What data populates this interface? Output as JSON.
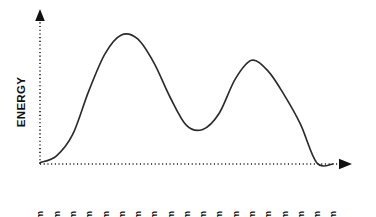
{
  "chart_data": {
    "type": "line",
    "title": "",
    "subtitle": "",
    "xlabel": "",
    "ylabel": "ENERGY",
    "grid": false,
    "legend": false,
    "legend_position": "none",
    "axis_style": "dotted-with-arrowheads",
    "xlim": [
      0,
      18
    ],
    "ylim": [
      0,
      100
    ],
    "categories": [
      "6am",
      "7am",
      "8am",
      "9am",
      "10am",
      "11am",
      "12pm",
      "1pm",
      "2pm",
      "3pm",
      "4pm",
      "5pm",
      "6pm",
      "7pm",
      "8pm",
      "9pm",
      "10pm",
      "11pm",
      "12am"
    ],
    "series": [
      {
        "name": "Energy",
        "color": "#2b2b2b",
        "values": [
          1,
          6,
          22,
          55,
          83,
          97,
          94,
          76,
          50,
          29,
          26,
          38,
          64,
          78,
          70,
          52,
          30,
          1,
          0
        ]
      }
    ],
    "annotations": {
      "peak_1": "11am",
      "trough": "3pm-4pm",
      "peak_2": "7pm"
    }
  },
  "axis": {
    "ylabel": "ENERGY",
    "ticks": [
      "6am",
      "7am",
      "8am",
      "9am",
      "10am",
      "11am",
      "12pm",
      "1pm",
      "2pm",
      "3pm",
      "4pm",
      "5pm",
      "6pm",
      "7pm",
      "8pm",
      "9pm",
      "10pm",
      "11pm",
      "12am"
    ]
  },
  "colors": {
    "curve": "#2b2b2b",
    "axis": "#1a1a1a",
    "text": "#111111",
    "background": "#ffffff"
  }
}
